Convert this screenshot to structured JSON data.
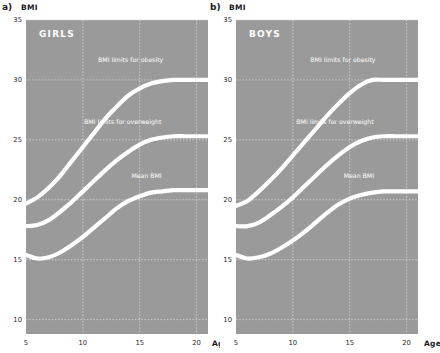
{
  "figure": {
    "background": "#ffffff",
    "plot_background": "#9a9a9a",
    "curve_color": "#ffffff",
    "grid_color": "#cfcfcf",
    "text_color": "#1a1a1a"
  },
  "panels": [
    {
      "letter": "a)",
      "title": "GIRLS",
      "y_axis_title": "BMI",
      "x_axis_title": "Age"
    },
    {
      "letter": "b)",
      "title": "BOYS",
      "y_axis_title": "BMI",
      "x_axis_title": "Age"
    }
  ],
  "chart_data": [
    {
      "type": "line",
      "title": "GIRLS",
      "panel": "a)",
      "xlabel": "Age",
      "ylabel": "BMI",
      "xlim": [
        5,
        21
      ],
      "ylim": [
        8.8,
        35
      ],
      "xticks": [
        5,
        10,
        15,
        20
      ],
      "yticks": [
        10,
        15,
        20,
        25,
        30,
        35
      ],
      "grid": true,
      "legend": "inline-annotations",
      "series": [
        {
          "name": "BMI limits for obesity",
          "x": [
            5,
            6,
            7,
            8,
            9,
            10,
            11,
            12,
            13,
            14,
            15,
            16,
            17,
            18,
            19,
            20,
            21
          ],
          "y": [
            19.7,
            20.2,
            21.0,
            22.0,
            23.2,
            24.4,
            25.6,
            26.8,
            27.8,
            28.7,
            29.3,
            29.7,
            29.9,
            30.0,
            30.0,
            30.0,
            30.0
          ]
        },
        {
          "name": "BMI limits for overweight",
          "x": [
            5,
            6,
            7,
            8,
            9,
            10,
            11,
            12,
            13,
            14,
            15,
            16,
            17,
            18,
            19,
            20,
            21
          ],
          "y": [
            17.8,
            17.9,
            18.3,
            19.0,
            19.8,
            20.7,
            21.6,
            22.5,
            23.3,
            24.0,
            24.6,
            25.0,
            25.2,
            25.3,
            25.3,
            25.3,
            25.3
          ]
        },
        {
          "name": "Mean BMI",
          "x": [
            5,
            6,
            7,
            8,
            9,
            10,
            11,
            12,
            13,
            14,
            15,
            16,
            17,
            18,
            19,
            20,
            21
          ],
          "y": [
            15.4,
            15.1,
            15.2,
            15.6,
            16.2,
            16.9,
            17.7,
            18.5,
            19.3,
            19.9,
            20.3,
            20.6,
            20.7,
            20.8,
            20.8,
            20.8,
            20.8
          ]
        }
      ],
      "annotations": [
        {
          "text": "BMI limits for obesity",
          "x": 14.2,
          "y": 31.5
        },
        {
          "text": "BMI limits for overweight",
          "x": 13.5,
          "y": 26.3
        },
        {
          "text": "Mean BMI",
          "x": 15.6,
          "y": 21.8
        }
      ]
    },
    {
      "type": "line",
      "title": "BOYS",
      "panel": "b)",
      "xlabel": "Age",
      "ylabel": "BMI",
      "xlim": [
        5,
        21
      ],
      "ylim": [
        8.8,
        35
      ],
      "xticks": [
        5,
        10,
        15,
        20
      ],
      "yticks": [
        10,
        15,
        20,
        25,
        30,
        35
      ],
      "grid": true,
      "legend": "inline-annotations",
      "series": [
        {
          "name": "BMI limits for obesity",
          "x": [
            5,
            6,
            7,
            8,
            9,
            10,
            11,
            12,
            13,
            14,
            15,
            16,
            17,
            18,
            19,
            20,
            21
          ],
          "y": [
            19.5,
            19.9,
            20.7,
            21.6,
            22.6,
            23.7,
            24.8,
            25.9,
            27.0,
            28.0,
            28.9,
            29.6,
            30.0,
            30.0,
            30.0,
            30.0,
            30.0
          ]
        },
        {
          "name": "BMI limits for overweight",
          "x": [
            5,
            6,
            7,
            8,
            9,
            10,
            11,
            12,
            13,
            14,
            15,
            16,
            17,
            18,
            19,
            20,
            21
          ],
          "y": [
            17.8,
            17.8,
            18.1,
            18.7,
            19.4,
            20.2,
            21.1,
            22.0,
            22.9,
            23.7,
            24.4,
            24.9,
            25.2,
            25.3,
            25.3,
            25.3,
            25.3
          ]
        },
        {
          "name": "Mean BMI",
          "x": [
            5,
            6,
            7,
            8,
            9,
            10,
            11,
            12,
            13,
            14,
            15,
            16,
            17,
            18,
            19,
            20,
            21
          ],
          "y": [
            15.4,
            15.1,
            15.2,
            15.5,
            16.0,
            16.6,
            17.3,
            18.1,
            18.9,
            19.6,
            20.1,
            20.4,
            20.6,
            20.7,
            20.7,
            20.7,
            20.7
          ]
        }
      ],
      "annotations": [
        {
          "text": "BMI limits for obesity",
          "x": 14.4,
          "y": 31.5
        },
        {
          "text": "BMI limits for overweight",
          "x": 13.7,
          "y": 26.3
        },
        {
          "text": "Mean BMI",
          "x": 15.8,
          "y": 21.8
        }
      ]
    }
  ]
}
